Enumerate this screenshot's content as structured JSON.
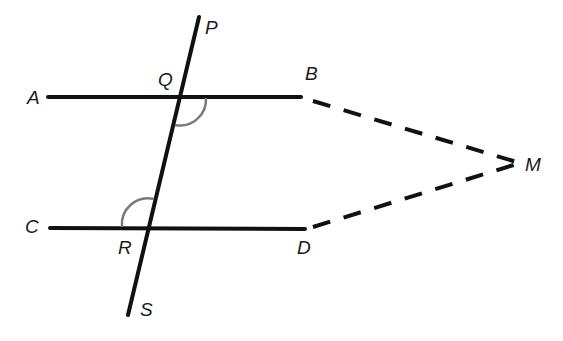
{
  "diagram": {
    "type": "geometry-parallel-lines-transversal",
    "colors": {
      "line": "#111111",
      "arc": "#7a7a7a",
      "background": "#ffffff"
    },
    "labels": {
      "P": "P",
      "Q": "Q",
      "A": "A",
      "B": "B",
      "C": "C",
      "R": "R",
      "D": "D",
      "S": "S",
      "M": "M"
    },
    "segments": [
      {
        "name": "AB",
        "style": "solid"
      },
      {
        "name": "CD",
        "style": "solid"
      },
      {
        "name": "PS",
        "style": "solid"
      },
      {
        "name": "BM",
        "style": "dashed"
      },
      {
        "name": "DM",
        "style": "dashed"
      }
    ],
    "angle_marks": [
      "angle BQR",
      "angle CRQ"
    ]
  }
}
